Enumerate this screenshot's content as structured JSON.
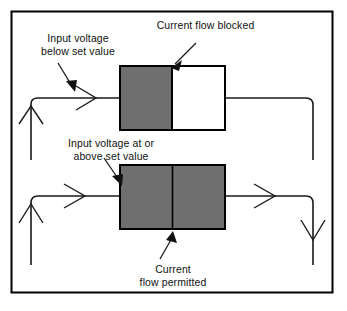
{
  "figure": {
    "border_color": "#000000",
    "wire_color": "#1a1a1a",
    "block_fill_gray": "#6f6f6f",
    "block_fill_white": "#ffffff",
    "block_stroke": "#000000"
  },
  "labels": {
    "input_below": "Input voltage\nbelow set value",
    "current_blocked": "Current flow blocked",
    "input_above": "Input voltage at or\nabove set value",
    "current_permitted": "Current\nflow permitted"
  },
  "circuits": [
    {
      "name": "blocked-circuit",
      "state": "blocked",
      "block_left_fill": "#6f6f6f",
      "block_right_fill": "#ffffff",
      "flow_arrows": [
        "right"
      ]
    },
    {
      "name": "permitted-circuit",
      "state": "permitted",
      "block_left_fill": "#6f6f6f",
      "block_right_fill": "#6f6f6f",
      "flow_arrows": [
        "up",
        "right",
        "right",
        "down"
      ]
    }
  ]
}
